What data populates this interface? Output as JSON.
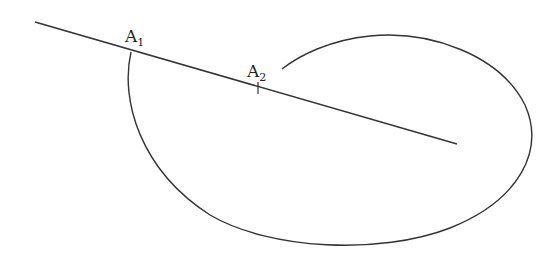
{
  "diagram": {
    "stroke_color": "#333333",
    "line": {
      "x1": 35,
      "y1": 22,
      "x2": 457,
      "y2": 144
    },
    "curve": {
      "description": "open closed-loop curve crossing the line at A1, wrapping around and ending near A2"
    },
    "points": [
      {
        "id": "A1",
        "label": "A",
        "subscript": "1",
        "label_x": 127,
        "label_y": 42
      },
      {
        "id": "A2",
        "label": "A",
        "subscript": "2",
        "label_x": 248,
        "label_y": 78
      }
    ]
  }
}
